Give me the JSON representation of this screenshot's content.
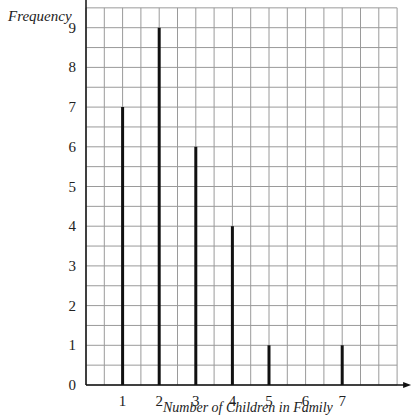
{
  "chart_data": {
    "type": "bar",
    "style": "vertical line graph (stick bars) on square grid paper",
    "title": "",
    "xlabel": "Number of Children in Family",
    "ylabel": "Frequency",
    "categories": [
      1,
      2,
      3,
      4,
      5,
      6,
      7
    ],
    "values": [
      7,
      9,
      6,
      4,
      1,
      0,
      1
    ],
    "x_ticks": [
      "1",
      "2",
      "3",
      "4",
      "5",
      "6",
      "7"
    ],
    "y_ticks": [
      "0",
      "1",
      "2",
      "3",
      "4",
      "5",
      "6",
      "7",
      "8",
      "9"
    ],
    "ylim": [
      0,
      9
    ],
    "grid": true,
    "legend": null,
    "colors": {
      "grid": "#9a9a9a",
      "axis": "#111111",
      "bars": "#111111"
    }
  }
}
